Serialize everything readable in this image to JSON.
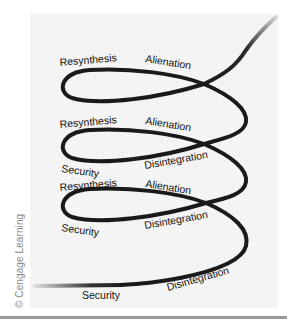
{
  "diagram": {
    "type": "spiral",
    "colors": {
      "line": "#1a1a1a",
      "panel": "#f4f4f4",
      "rule": "#9a9a9a"
    },
    "loops": [
      {
        "top_left": "Resynthesis",
        "top_right": "Alienation"
      },
      {
        "top_left": "Resynthesis",
        "top_right": "Alienation",
        "bottom_left": "Security",
        "bottom_right": "Disintegration"
      },
      {
        "top_left": "Resynthesis",
        "top_right": "Alienation",
        "bottom_left": "Security",
        "bottom_right": "Disintegration"
      }
    ],
    "base": {
      "left": "Security",
      "right": "Disintegration"
    }
  },
  "credit": "© Cengage Learning"
}
